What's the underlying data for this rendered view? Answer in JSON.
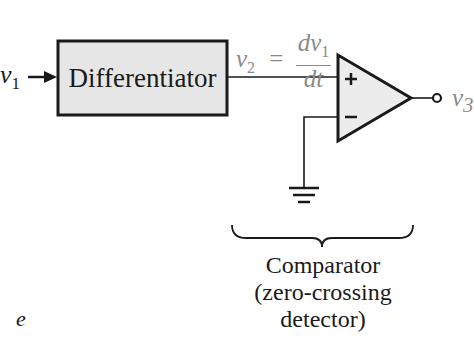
{
  "diagram": {
    "input_label": {
      "var": "v",
      "sub": "1"
    },
    "block_label": "Differentiator",
    "equation": {
      "lhs_var": "v",
      "lhs_sub": "2",
      "equals": "=",
      "numerator": "dv",
      "numerator_sub": "1",
      "denominator": "dt"
    },
    "opamp": {
      "plus_sign": "+",
      "minus_sign": "−"
    },
    "output_label": {
      "var": "v",
      "sub": "3"
    },
    "caption_lines": [
      "Comparator",
      "(zero-crossing",
      "detector)"
    ],
    "partial_text": "e",
    "colors": {
      "line": "#1a1a1a",
      "block_fill": "#e6e6e6",
      "opamp_fill": "#ececec",
      "equation_text": "#8a8a8a"
    }
  }
}
